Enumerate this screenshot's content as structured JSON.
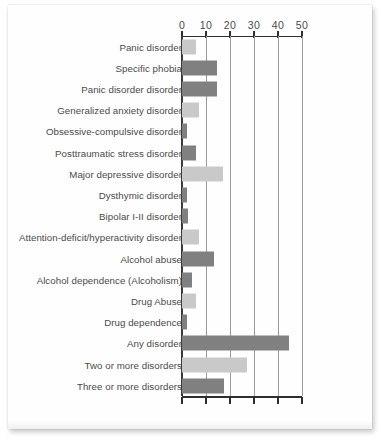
{
  "chart_data": {
    "type": "bar",
    "orientation": "horizontal",
    "title": "",
    "subtitle": "",
    "xlabel": "",
    "ylabel": "",
    "xlim": [
      0,
      50
    ],
    "xticks": [
      0,
      10,
      20,
      30,
      40,
      50
    ],
    "xtick_labels": [
      "0",
      "10",
      "20",
      "30",
      "40",
      "50"
    ],
    "grid": true,
    "grid_axis": "x",
    "legend": "none",
    "categories": [
      "Panic disorder",
      "Specific phobia",
      "Panic disorder disorder",
      "Generalized anxiety disorder",
      "Obsessive-compulsive disorder",
      "Posttraumatic stress disorder",
      "Major depressive disorder",
      "Dysthymic disorder",
      "Bipolar I-II disorder",
      "Attention-deficit/hyperactivity disorder",
      "Alcohol abuse",
      "Alcohol dependence (Alcoholism)",
      "Drug Abuse",
      "Drug dependence",
      "Any disorder",
      "Two or more disorders",
      "Three or more disorders"
    ],
    "values": [
      6,
      14.5,
      14.5,
      7,
      2,
      6,
      17,
      2.2,
      2.6,
      7.2,
      13.5,
      4.2,
      6,
      2,
      44.5,
      27,
      17.5
    ],
    "bar_colors": [
      "#c9c9c9",
      "#808080",
      "#808080",
      "#c9c9c9",
      "#808080",
      "#808080",
      "#c9c9c9",
      "#808080",
      "#808080",
      "#c9c9c9",
      "#808080",
      "#808080",
      "#c9c9c9",
      "#808080",
      "#808080",
      "#c9c9c9",
      "#808080"
    ]
  },
  "style": {
    "axis_color": "#2e2e2e",
    "gridline_color": "#9a9a9a",
    "label_color": "#4a4a4a",
    "page_background": "#fefefe"
  }
}
